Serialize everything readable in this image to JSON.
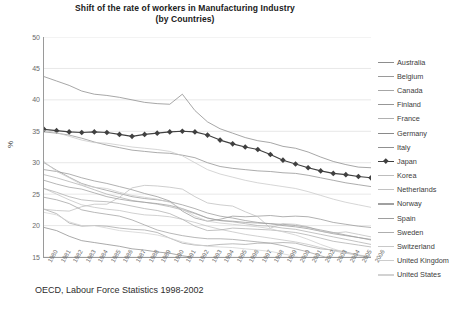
{
  "title": {
    "line1": "Shift of the rate of workers in Manufacturing Industry",
    "line2": "(by Countries)"
  },
  "caption": "OECD, Labour Force Statistics 1998-2002",
  "chart_data": {
    "type": "line",
    "title": "Shift of the rate of workers in Manufacturing Industry (by Countries)",
    "subtitle": "(by Countries)",
    "source": "OECD, Labour Force Statistics 1998-2002",
    "xlabel": "",
    "ylabel": "%",
    "ylim": [
      15,
      50
    ],
    "yticks": [
      15,
      20,
      25,
      30,
      35,
      40,
      45,
      50
    ],
    "grid": true,
    "legend_position": "right",
    "x": [
      1980,
      1981,
      1982,
      1983,
      1984,
      1985,
      1986,
      1987,
      1988,
      1989,
      1990,
      1991,
      1992,
      1993,
      1994,
      1995,
      1996,
      1997,
      1998,
      1999,
      2000,
      2001,
      2002,
      2003,
      2004,
      2005,
      2006
    ],
    "series": [
      {
        "name": "Australia",
        "color": "#8d8d8d",
        "marker": "none",
        "values": [
          19.7,
          19.2,
          18.3,
          17.6,
          17.3,
          17.0,
          16.7,
          16.3,
          16.1,
          15.8,
          15.6,
          15.2,
          14.9,
          14.7,
          14.5,
          14.3,
          14.0,
          13.7,
          13.5,
          13.2,
          13.0,
          12.7,
          12.4,
          12.1,
          11.8,
          11.5,
          11.2
        ]
      },
      {
        "name": "Belgium",
        "color": "#9a9a9a",
        "marker": "none",
        "values": [
          30.0,
          28.8,
          27.7,
          26.7,
          26.1,
          25.6,
          25.1,
          24.6,
          24.3,
          24.1,
          23.8,
          23.3,
          22.7,
          22.0,
          21.5,
          21.2,
          20.8,
          20.5,
          20.3,
          20.0,
          19.8,
          19.5,
          19.1,
          18.7,
          18.4,
          18.1,
          17.8
        ]
      },
      {
        "name": "Canada",
        "color": "#a6a6a6",
        "marker": "none",
        "values": [
          22.6,
          21.9,
          20.4,
          19.9,
          20.0,
          19.9,
          19.6,
          19.4,
          19.3,
          18.9,
          18.0,
          17.2,
          16.9,
          16.8,
          17.0,
          17.1,
          17.0,
          17.2,
          17.2,
          17.3,
          17.2,
          16.7,
          16.3,
          16.1,
          15.8,
          15.3,
          14.8
        ]
      },
      {
        "name": "Finland",
        "color": "#979797",
        "marker": "none",
        "values": [
          28.9,
          28.6,
          28.2,
          27.6,
          27.1,
          26.7,
          26.2,
          25.7,
          25.1,
          24.6,
          23.9,
          22.3,
          21.2,
          20.7,
          21.0,
          21.5,
          21.4,
          21.5,
          21.6,
          21.4,
          21.5,
          21.4,
          21.0,
          20.5,
          20.2,
          19.9,
          19.7
        ]
      },
      {
        "name": "France",
        "color": "#b0b0b0",
        "marker": "none",
        "values": [
          28.1,
          27.6,
          27.0,
          26.4,
          25.7,
          25.0,
          24.5,
          24.0,
          23.7,
          23.4,
          23.0,
          22.5,
          21.9,
          21.2,
          20.8,
          20.6,
          20.3,
          20.0,
          19.9,
          19.6,
          19.4,
          19.0,
          18.6,
          18.2,
          17.8,
          17.4,
          17.0
        ]
      },
      {
        "name": "Germany",
        "color": "#8a8a8a",
        "marker": "none",
        "values": [
          43.7,
          43.0,
          42.3,
          41.4,
          40.9,
          40.7,
          40.4,
          40.0,
          39.6,
          39.4,
          39.3,
          40.9,
          38.3,
          36.5,
          35.4,
          34.7,
          34.0,
          33.5,
          33.2,
          32.6,
          32.3,
          31.7,
          30.9,
          30.2,
          29.7,
          29.3,
          29.2
        ]
      },
      {
        "name": "Italy",
        "color": "#909090",
        "marker": "none",
        "values": [
          34.9,
          34.7,
          34.4,
          33.9,
          33.3,
          32.8,
          32.4,
          32.0,
          31.8,
          31.6,
          31.5,
          31.2,
          30.8,
          30.0,
          29.4,
          29.1,
          28.9,
          28.7,
          28.6,
          28.4,
          28.3,
          28.0,
          27.6,
          27.2,
          26.8,
          26.5,
          26.2
        ]
      },
      {
        "name": "Japan",
        "color": "#404040",
        "marker": "diamond",
        "values": [
          35.3,
          35.1,
          34.9,
          34.8,
          34.9,
          34.8,
          34.5,
          34.2,
          34.5,
          34.7,
          34.9,
          35.0,
          34.9,
          34.4,
          33.6,
          33.0,
          32.5,
          32.1,
          31.3,
          30.4,
          29.8,
          29.2,
          28.7,
          28.3,
          28.1,
          27.8,
          27.6
        ]
      },
      {
        "name": "Korea",
        "color": "#bdbdbd",
        "marker": "none",
        "values": [
          22.6,
          22.4,
          22.3,
          23.0,
          23.4,
          23.4,
          24.5,
          26.0,
          26.4,
          26.3,
          26.1,
          25.8,
          24.6,
          23.6,
          23.3,
          23.1,
          22.2,
          21.4,
          19.6,
          20.3,
          20.2,
          19.8,
          19.1,
          18.8,
          19.0,
          18.6,
          18.2
        ]
      },
      {
        "name": "Netherlands",
        "color": "#c2c2c2",
        "marker": "none",
        "values": [
          25.9,
          25.0,
          24.1,
          23.3,
          22.9,
          22.6,
          22.4,
          22.0,
          21.7,
          21.6,
          21.4,
          21.0,
          20.5,
          19.9,
          19.4,
          19.0,
          18.6,
          18.3,
          18.0,
          17.7,
          17.4,
          17.0,
          16.5,
          16.0,
          15.6,
          15.3,
          15.1
        ]
      },
      {
        "name": "Norway",
        "color": "#a0a0a0",
        "marker": "none",
        "values": [
          24.5,
          24.1,
          23.5,
          22.5,
          22.1,
          21.8,
          21.5,
          20.9,
          20.1,
          19.3,
          18.8,
          18.4,
          18.1,
          17.9,
          17.9,
          17.8,
          17.6,
          17.4,
          17.2,
          16.8,
          16.3,
          15.8,
          15.2,
          14.6,
          14.2,
          13.9,
          13.6
        ]
      },
      {
        "name": "Spain",
        "color": "#9e9e9e",
        "marker": "none",
        "values": [
          27.2,
          26.6,
          26.1,
          25.8,
          25.2,
          24.6,
          24.2,
          23.9,
          23.7,
          23.5,
          23.2,
          22.7,
          22.0,
          21.2,
          20.8,
          20.7,
          20.5,
          20.4,
          20.3,
          20.2,
          20.0,
          19.7,
          19.3,
          18.9,
          18.5,
          18.1,
          17.7
        ]
      },
      {
        "name": "Sweden",
        "color": "#aeaeae",
        "marker": "none",
        "values": [
          25.9,
          25.3,
          24.6,
          24.1,
          23.9,
          23.8,
          23.5,
          23.1,
          22.7,
          22.4,
          21.9,
          21.0,
          19.9,
          19.2,
          19.3,
          19.6,
          19.5,
          19.4,
          19.3,
          19.1,
          18.9,
          18.5,
          18.0,
          17.5,
          17.2,
          16.9,
          16.6
        ]
      },
      {
        "name": "Switzerland",
        "color": "#c8c8c8",
        "marker": "none",
        "values": [
          35.1,
          34.8,
          34.2,
          33.6,
          33.2,
          33.1,
          32.8,
          32.5,
          32.3,
          32.1,
          31.8,
          31.1,
          30.0,
          28.9,
          28.2,
          27.7,
          27.2,
          26.8,
          26.5,
          26.2,
          25.9,
          25.4,
          24.8,
          24.2,
          23.7,
          23.3,
          22.9
        ]
      },
      {
        "name": "United Kingdom",
        "color": "#cccccc",
        "marker": "none",
        "values": [
          30.2,
          28.6,
          27.6,
          26.5,
          26.1,
          25.9,
          25.3,
          24.8,
          24.5,
          24.2,
          23.7,
          22.6,
          21.5,
          20.7,
          20.4,
          20.2,
          20.0,
          19.8,
          19.5,
          19.0,
          18.5,
          17.8,
          17.0,
          16.3,
          15.7,
          15.2,
          14.8
        ]
      },
      {
        "name": "United States",
        "color": "#d2d2d2",
        "marker": "none",
        "values": [
          22.1,
          21.7,
          20.6,
          20.0,
          20.0,
          19.6,
          19.2,
          19.0,
          18.8,
          18.5,
          18.0,
          17.4,
          17.0,
          16.7,
          16.6,
          16.5,
          16.3,
          16.1,
          15.9,
          15.5,
          15.1,
          14.3,
          13.6,
          13.1,
          12.8,
          12.6,
          12.4
        ]
      }
    ]
  }
}
